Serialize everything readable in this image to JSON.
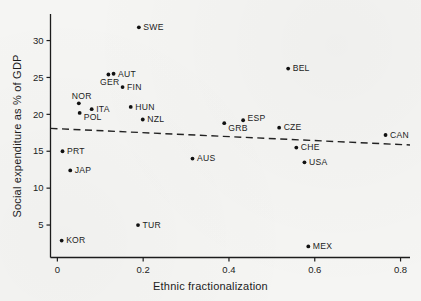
{
  "figure": {
    "kind": "scanned-book-scatter-plot",
    "background": "#f5f5f3"
  },
  "chart_data": {
    "type": "scatter",
    "title": "",
    "xlabel": "Ethnic fractionalization",
    "ylabel": "Social expenditure as % of GDP",
    "xlim": [
      -0.016,
      0.822
    ],
    "ylim": [
      0.6,
      33.6
    ],
    "x_ticks": [
      0,
      0.2,
      0.4,
      0.6,
      0.8
    ],
    "x_tick_labels": [
      "0",
      "0.2",
      "0.4",
      "0.6",
      "0.8"
    ],
    "y_ticks": [
      5,
      10,
      15,
      20,
      25,
      30
    ],
    "y_tick_labels": [
      "5",
      "10",
      "15",
      "20",
      "25",
      "30"
    ],
    "grid": false,
    "legend": "none",
    "point_color": "#111111",
    "line_color": "#222222",
    "text_color": "#1c1c1c",
    "points": [
      {
        "label": "SWE",
        "x": 0.19,
        "y": 31.8,
        "label_pos": "right"
      },
      {
        "label": "BEL",
        "x": 0.538,
        "y": 26.2,
        "label_pos": "right"
      },
      {
        "label": "AUT",
        "x": 0.131,
        "y": 25.5,
        "label_pos": "right"
      },
      {
        "label": "GER",
        "x": 0.119,
        "y": 25.4,
        "label_pos": "below-left"
      },
      {
        "label": "FIN",
        "x": 0.152,
        "y": 23.7,
        "label_pos": "right"
      },
      {
        "label": "NOR",
        "x": 0.05,
        "y": 21.5,
        "label_pos": "above"
      },
      {
        "label": "HUN",
        "x": 0.171,
        "y": 21.0,
        "label_pos": "right"
      },
      {
        "label": "ITA",
        "x": 0.08,
        "y": 20.7,
        "label_pos": "right"
      },
      {
        "label": "POL",
        "x": 0.052,
        "y": 20.2,
        "label_pos": "right-below"
      },
      {
        "label": "NZL",
        "x": 0.199,
        "y": 19.3,
        "label_pos": "right"
      },
      {
        "label": "ESP",
        "x": 0.433,
        "y": 19.2,
        "label_pos": "right-above"
      },
      {
        "label": "GRB",
        "x": 0.389,
        "y": 18.8,
        "label_pos": "right-below"
      },
      {
        "label": "CZE",
        "x": 0.517,
        "y": 18.2,
        "label_pos": "right"
      },
      {
        "label": "CAN",
        "x": 0.765,
        "y": 17.2,
        "label_pos": "right"
      },
      {
        "label": "CHE",
        "x": 0.557,
        "y": 15.5,
        "label_pos": "right"
      },
      {
        "label": "PRT",
        "x": 0.012,
        "y": 15.0,
        "label_pos": "right"
      },
      {
        "label": "AUS",
        "x": 0.315,
        "y": 14.0,
        "label_pos": "right"
      },
      {
        "label": "USA",
        "x": 0.576,
        "y": 13.5,
        "label_pos": "right"
      },
      {
        "label": "JAP",
        "x": 0.03,
        "y": 12.4,
        "label_pos": "right"
      },
      {
        "label": "TUR",
        "x": 0.188,
        "y": 5.0,
        "label_pos": "right"
      },
      {
        "label": "KOR",
        "x": 0.01,
        "y": 2.9,
        "label_pos": "right"
      },
      {
        "label": "MEX",
        "x": 0.585,
        "y": 2.1,
        "label_pos": "right"
      }
    ],
    "trend_line": {
      "style": "dashed",
      "x1": -0.016,
      "y1": 18.1,
      "x2": 0.822,
      "y2": 15.85
    }
  }
}
